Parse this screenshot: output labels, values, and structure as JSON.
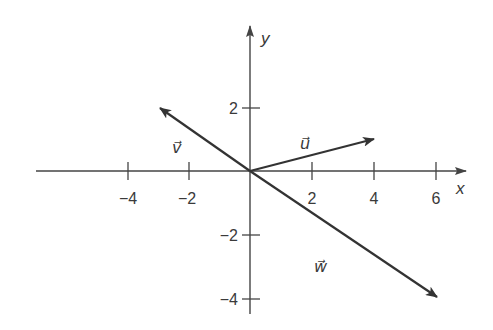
{
  "diagram": {
    "type": "vector-plot",
    "axes": {
      "x_label": "x",
      "y_label": "y",
      "x_ticks": [
        {
          "value": -4,
          "label": "−4"
        },
        {
          "value": -2,
          "label": "−2"
        },
        {
          "value": 2,
          "label": "2"
        },
        {
          "value": 4,
          "label": "4"
        },
        {
          "value": 6,
          "label": "6"
        }
      ],
      "y_ticks": [
        {
          "value": 2,
          "label": "2"
        },
        {
          "value": -2,
          "label": "−2"
        },
        {
          "value": -4,
          "label": "−4"
        }
      ]
    },
    "vectors": [
      {
        "name": "u",
        "label": "u⃗",
        "from": [
          0,
          0
        ],
        "to": [
          4,
          1
        ]
      },
      {
        "name": "v",
        "label": "v⃗",
        "from": [
          0,
          0
        ],
        "to": [
          -3,
          2
        ]
      },
      {
        "name": "w",
        "label": "w⃗",
        "from": [
          0,
          0
        ],
        "to": [
          6,
          -4
        ]
      }
    ],
    "colors": {
      "stroke": "#333333",
      "background": "#ffffff"
    }
  }
}
